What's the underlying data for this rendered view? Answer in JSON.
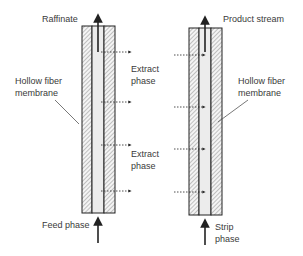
{
  "diagram": {
    "type": "hollow fiber membrane extraction schematic",
    "left_module": {
      "top_label": "Raffinate",
      "bottom_label": "Feed phase",
      "side_label_line1": "Hollow fiber",
      "side_label_line2": "membrane"
    },
    "middle": {
      "label_upper_line1": "Extract",
      "label_upper_line2": "phase",
      "label_lower_line1": "Extract",
      "label_lower_line2": "phase"
    },
    "right_module": {
      "top_label": "Product stream",
      "bottom_label_line1": "Strip",
      "bottom_label_line2": "phase",
      "side_label_line1": "Hollow fiber",
      "side_label_line2": "membrane"
    },
    "colors": {
      "line": "#222222",
      "hatch": "#8a8a8a",
      "channel": "#ececec",
      "text": "#3a3a3a"
    }
  }
}
